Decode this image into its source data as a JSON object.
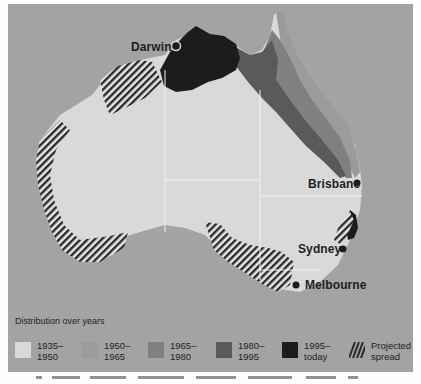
{
  "map": {
    "title": "Distribution over years",
    "colors": {
      "background": "#fdfdfd",
      "sea": "#a3a3a3",
      "land_1935_1950": "#d9d9d9",
      "land_1950_1965": "#9b9b9b",
      "land_1965_1980": "#808080",
      "land_1980_1995": "#5a5a5a",
      "land_1995_today": "#1c1c1c",
      "hatch": "#2a2a2a",
      "borders": "#f0f0f0"
    },
    "cities": [
      {
        "name": "Darwin",
        "marker": "ring-dot"
      },
      {
        "name": "Brisbane",
        "marker": "dot"
      },
      {
        "name": "Sydney",
        "marker": "dot"
      },
      {
        "name": "Melbourne",
        "marker": "dot"
      }
    ]
  },
  "legend": {
    "title": "Distribution over years",
    "items": [
      {
        "label": "1935–\n1950",
        "color": "#d9d9d9",
        "pattern": "solid"
      },
      {
        "label": "1950–\n1965",
        "color": "#9b9b9b",
        "pattern": "solid"
      },
      {
        "label": "1965–\n1980",
        "color": "#808080",
        "pattern": "solid"
      },
      {
        "label": "1980–\n1995",
        "color": "#5a5a5a",
        "pattern": "solid"
      },
      {
        "label": "1995–\ntoday",
        "color": "#1c1c1c",
        "pattern": "solid"
      },
      {
        "label": "Projected\nspread",
        "color": "#2a2a2a",
        "pattern": "hatch"
      }
    ]
  }
}
